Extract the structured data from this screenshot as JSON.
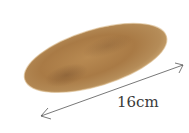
{
  "image": {
    "subject": "bread-roll",
    "colors": {
      "crust_light": "#c49a5e",
      "crust_mid": "#a97a45",
      "crust_dark": "#8a5e32",
      "arrow": "#555555",
      "label": "#3a3a3a",
      "background": "#ffffff"
    }
  },
  "dimension": {
    "label": "16cm"
  }
}
